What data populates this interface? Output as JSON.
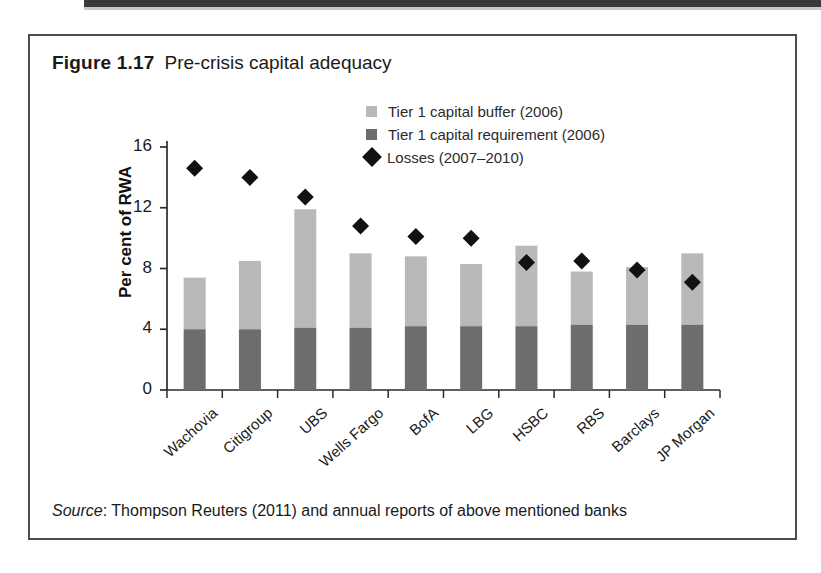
{
  "figure": {
    "number": "Figure 1.17",
    "caption": "Pre-crisis capital adequacy",
    "source_word": "Source",
    "source_text": ": Thompson Reuters (2011) and annual reports of above mentioned banks"
  },
  "colors": {
    "buffer": "#b9b9b9",
    "requirement": "#6d6d6d",
    "losses": "#111111",
    "axis": "#2b2b2b",
    "border": "#4c4c4c",
    "text": "#1a1a1a"
  },
  "legend": {
    "position": "top-right",
    "entries": [
      {
        "label": "Tier 1 capital buffer (2006)",
        "marker": "square",
        "color": "#b9b9b9",
        "icon": "square-swatch-icon"
      },
      {
        "label": "Tier 1 capital requirement (2006)",
        "marker": "square",
        "color": "#6d6d6d",
        "icon": "square-swatch-icon"
      },
      {
        "label": "Losses (2007–2010)",
        "marker": "diamond",
        "color": "#111111",
        "icon": "diamond-marker-icon"
      }
    ]
  },
  "chart_data": {
    "type": "bar",
    "subtype": "stacked-bar-with-scatter-overlay",
    "title": "Pre-crisis capital adequacy",
    "xlabel": "",
    "ylabel": "Per cent of RWA",
    "ylim": [
      0,
      16
    ],
    "yticks": [
      0,
      4,
      8,
      12,
      16
    ],
    "ytick_labels": [
      "0",
      "4",
      "8",
      "12",
      "16"
    ],
    "grid": false,
    "legend_position": "top-right",
    "categories": [
      "Wachovia",
      "Citigroup",
      "UBS",
      "Wells Fargo",
      "BofA",
      "LBG",
      "HSBC",
      "RBS",
      "Barclays",
      "JP Morgan"
    ],
    "series": [
      {
        "name": "Tier 1 capital requirement (2006)",
        "type": "bar-segment",
        "stack_order": "bottom",
        "color": "#6d6d6d",
        "values": [
          4.0,
          4.0,
          4.1,
          4.1,
          4.2,
          4.2,
          4.2,
          4.3,
          4.3,
          4.3
        ]
      },
      {
        "name": "Tier 1 capital buffer (2006)",
        "type": "bar-segment",
        "stack_order": "top",
        "color": "#b9b9b9",
        "values": [
          3.4,
          4.5,
          7.8,
          4.9,
          4.6,
          4.1,
          5.3,
          3.5,
          3.8,
          4.7
        ]
      },
      {
        "name": "Losses (2007–2010)",
        "type": "scatter",
        "marker": "diamond",
        "color": "#111111",
        "values": [
          14.6,
          14.0,
          12.7,
          10.8,
          10.1,
          10.0,
          8.4,
          8.5,
          7.9,
          7.1
        ]
      }
    ],
    "bar_totals": [
      7.4,
      8.5,
      11.9,
      9.0,
      8.8,
      8.3,
      9.5,
      7.8,
      8.1,
      9.0
    ]
  }
}
